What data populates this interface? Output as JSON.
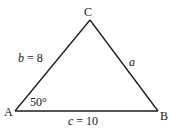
{
  "diagram": {
    "type": "triangle",
    "stroke_color": "#1a1a1a",
    "vertices": {
      "A": {
        "label": "A",
        "x": 15,
        "y": 111
      },
      "B": {
        "label": "B",
        "x": 158,
        "y": 111
      },
      "C": {
        "label": "C",
        "x": 90,
        "y": 20
      }
    },
    "sides": {
      "b": {
        "var": "b",
        "eq": "=",
        "value": "8",
        "between": [
          "A",
          "C"
        ]
      },
      "a": {
        "var": "a",
        "between": [
          "C",
          "B"
        ]
      },
      "c": {
        "var": "c",
        "eq": "=",
        "value": "10",
        "between": [
          "A",
          "B"
        ]
      }
    },
    "angle_A": {
      "text": "50°"
    }
  }
}
